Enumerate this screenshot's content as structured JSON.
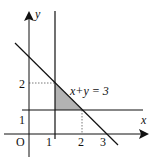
{
  "diagram": {
    "type": "linear-inequality-region",
    "axes": {
      "x_label": "x",
      "y_label": "y",
      "origin_label": "O",
      "x_ticks": [
        "1",
        "2",
        "3"
      ],
      "y_ticks": [
        "1",
        "2"
      ]
    },
    "lines": [
      {
        "name": "x = 1",
        "kind": "vertical"
      },
      {
        "name": "y = 1",
        "kind": "horizontal"
      },
      {
        "name": "x+y = 3",
        "kind": "diagonal",
        "label": "x+y = 3"
      }
    ],
    "region": {
      "vertices": [
        [
          1,
          1
        ],
        [
          1,
          2
        ],
        [
          2,
          1
        ]
      ],
      "fill": "#b3b3b3"
    },
    "guides": [
      {
        "from": [
          0,
          2
        ],
        "to": [
          1,
          2
        ],
        "style": "dotted"
      },
      {
        "from": [
          2,
          0
        ],
        "to": [
          2,
          1
        ],
        "style": "dotted"
      }
    ],
    "colors": {
      "line": "#111111",
      "shade": "#b3b3b3",
      "dotted": "#555555"
    }
  }
}
